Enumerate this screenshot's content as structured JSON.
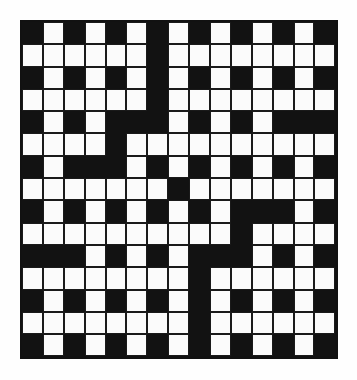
{
  "page": {
    "background_color": "#ffffff"
  },
  "grid": {
    "name": "crossword-grid",
    "rows": 15,
    "columns": 15,
    "cell_width": 20.9,
    "cell_height": 22.3,
    "origin_x": 20,
    "origin_y": 20,
    "white_color": "#fbfbfb",
    "black_color": "#121212",
    "border_color": "#1a1a1a",
    "legend": {
      "0": "white-cell",
      "1": "black-cell"
    },
    "cells": [
      [
        1,
        0,
        1,
        0,
        1,
        0,
        1,
        0,
        1,
        0,
        1,
        0,
        1,
        0,
        1
      ],
      [
        0,
        0,
        0,
        0,
        0,
        0,
        1,
        0,
        0,
        0,
        0,
        0,
        0,
        0,
        0
      ],
      [
        1,
        0,
        1,
        0,
        1,
        0,
        1,
        0,
        1,
        0,
        1,
        0,
        1,
        0,
        1
      ],
      [
        0,
        0,
        0,
        0,
        0,
        0,
        1,
        0,
        0,
        0,
        0,
        0,
        0,
        0,
        0
      ],
      [
        1,
        0,
        1,
        0,
        1,
        1,
        1,
        0,
        1,
        0,
        1,
        0,
        1,
        1,
        1
      ],
      [
        0,
        0,
        0,
        0,
        1,
        0,
        0,
        0,
        0,
        0,
        0,
        0,
        0,
        0,
        0
      ],
      [
        1,
        0,
        1,
        1,
        1,
        0,
        1,
        0,
        1,
        0,
        1,
        0,
        1,
        0,
        1
      ],
      [
        0,
        0,
        0,
        0,
        0,
        0,
        0,
        1,
        0,
        0,
        0,
        0,
        0,
        0,
        0
      ],
      [
        1,
        0,
        1,
        0,
        1,
        0,
        1,
        0,
        1,
        0,
        1,
        1,
        1,
        0,
        1
      ],
      [
        0,
        0,
        0,
        0,
        0,
        0,
        0,
        0,
        0,
        0,
        1,
        0,
        0,
        0,
        0
      ],
      [
        1,
        1,
        1,
        0,
        1,
        0,
        1,
        0,
        1,
        1,
        1,
        0,
        1,
        0,
        1
      ],
      [
        0,
        0,
        0,
        0,
        0,
        0,
        0,
        0,
        1,
        0,
        0,
        0,
        0,
        0,
        0
      ],
      [
        1,
        0,
        1,
        0,
        1,
        0,
        1,
        0,
        1,
        0,
        1,
        0,
        1,
        0,
        1
      ],
      [
        0,
        0,
        0,
        0,
        0,
        0,
        0,
        0,
        1,
        0,
        0,
        0,
        0,
        0,
        0
      ],
      [
        1,
        0,
        1,
        0,
        1,
        0,
        1,
        0,
        1,
        0,
        1,
        0,
        1,
        0,
        1
      ]
    ]
  }
}
